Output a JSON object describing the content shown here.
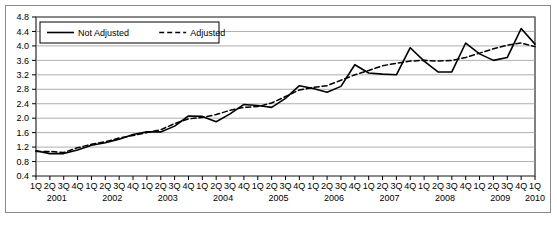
{
  "chart_data": {
    "type": "line",
    "title": "",
    "xlabel": "",
    "ylabel": "",
    "ylim": [
      0.4,
      4.8
    ],
    "ytick_step": 0.4,
    "yticks": [
      "0.4",
      "0.8",
      "1.2",
      "1.6",
      "2.0",
      "2.4",
      "2.8",
      "3.2",
      "3.6",
      "4.0",
      "4.4",
      "4.8"
    ],
    "grid": true,
    "legend_position": "top-left",
    "quarter_labels": [
      "1Q",
      "2Q",
      "3Q",
      "4Q",
      "1Q",
      "2Q",
      "3Q",
      "4Q",
      "1Q",
      "2Q",
      "3Q",
      "4Q",
      "1Q",
      "2Q",
      "3Q",
      "4Q",
      "1Q",
      "2Q",
      "3Q",
      "4Q",
      "1Q",
      "2Q",
      "3Q",
      "4Q",
      "1Q",
      "2Q",
      "3Q",
      "4Q",
      "1Q",
      "2Q",
      "3Q",
      "4Q",
      "1Q",
      "2Q",
      "3Q",
      "4Q",
      "1Q"
    ],
    "year_labels": [
      "2001",
      "2002",
      "2003",
      "2004",
      "2005",
      "2006",
      "2007",
      "2008",
      "2009",
      "2010"
    ],
    "categories": [
      "1Q2001",
      "2Q2001",
      "3Q2001",
      "4Q2001",
      "1Q2002",
      "2Q2002",
      "3Q2002",
      "4Q2002",
      "1Q2003",
      "2Q2003",
      "3Q2003",
      "4Q2003",
      "1Q2004",
      "2Q2004",
      "3Q2004",
      "4Q2004",
      "1Q2005",
      "2Q2005",
      "3Q2005",
      "4Q2005",
      "1Q2006",
      "2Q2006",
      "3Q2006",
      "4Q2006",
      "1Q2007",
      "2Q2007",
      "3Q2007",
      "4Q2007",
      "1Q2008",
      "2Q2008",
      "3Q2008",
      "4Q2008",
      "1Q2009",
      "2Q2009",
      "3Q2009",
      "4Q2009",
      "1Q2010"
    ],
    "series": [
      {
        "name": "Not Adjusted",
        "style": "solid",
        "color": "#000000",
        "values": [
          1.1,
          1.02,
          1.02,
          1.12,
          1.25,
          1.32,
          1.42,
          1.55,
          1.62,
          1.62,
          1.78,
          2.06,
          2.05,
          1.9,
          2.12,
          2.38,
          2.35,
          2.3,
          2.55,
          2.9,
          2.82,
          2.72,
          2.88,
          3.48,
          3.25,
          3.22,
          3.2,
          3.95,
          3.58,
          3.28,
          3.28,
          4.08,
          3.78,
          3.6,
          3.68,
          4.48,
          4.05
        ]
      },
      {
        "name": "Adjusted",
        "style": "dashed",
        "color": "#000000",
        "values": [
          1.08,
          1.08,
          1.05,
          1.18,
          1.28,
          1.35,
          1.45,
          1.52,
          1.6,
          1.68,
          1.85,
          1.98,
          2.02,
          2.1,
          2.22,
          2.3,
          2.32,
          2.42,
          2.6,
          2.78,
          2.85,
          2.9,
          3.05,
          3.2,
          3.32,
          3.45,
          3.52,
          3.58,
          3.6,
          3.58,
          3.6,
          3.68,
          3.8,
          3.92,
          4.02,
          4.08,
          3.98
        ]
      }
    ]
  },
  "legend": {
    "items": [
      {
        "label": "Not Adjusted",
        "style": "solid"
      },
      {
        "label": "Adjusted",
        "style": "dashed"
      }
    ]
  }
}
